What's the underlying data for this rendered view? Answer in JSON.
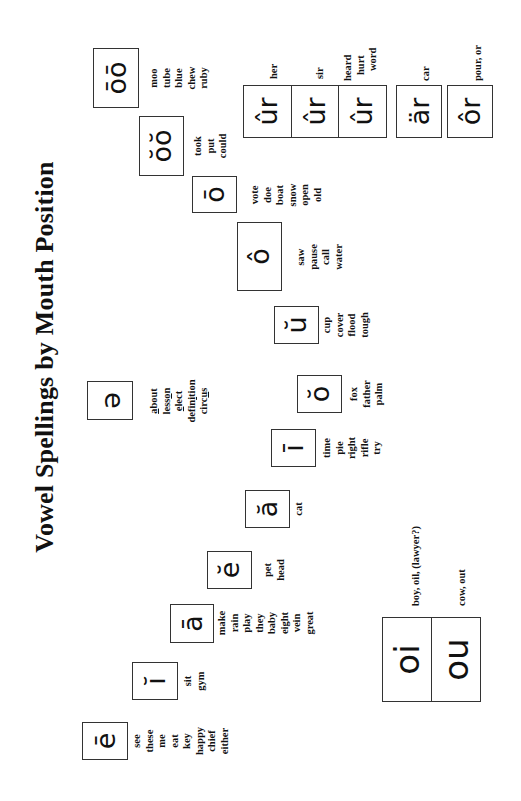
{
  "title": "Vowel Spellings by Mouth Position",
  "vowels": [
    {
      "symbol": "ē",
      "words": [
        "see",
        "these",
        "me",
        "eat",
        "key",
        "happy",
        "chief",
        "either"
      ]
    },
    {
      "symbol": "ĭ",
      "words": [
        "sit",
        "gym"
      ]
    },
    {
      "symbol": "ā",
      "words": [
        "make",
        "rain",
        "play",
        "they",
        "baby",
        "eight",
        "vein",
        "great"
      ]
    },
    {
      "symbol": "ĕ",
      "words": [
        "pet",
        "head"
      ]
    },
    {
      "symbol": "ă",
      "words": [
        "cat"
      ]
    },
    {
      "symbol": "ī",
      "words": [
        "time",
        "pie",
        "right",
        "rifle",
        "try"
      ]
    },
    {
      "symbol": "ŏ",
      "words": [
        "fox",
        "father",
        "palm"
      ]
    },
    {
      "symbol": "ŭ",
      "words": [
        "cup",
        "cover",
        "flood",
        "tough"
      ]
    },
    {
      "symbol": "ô",
      "words": [
        "saw",
        "pause",
        "call",
        "water"
      ]
    },
    {
      "symbol": "ō",
      "words": [
        "vote",
        "doe",
        "boat",
        "snow",
        "open",
        "old"
      ]
    },
    {
      "symbol": "ŏŏ",
      "words": [
        "took",
        "put",
        "could"
      ]
    },
    {
      "symbol": "ōō",
      "words": [
        "moo",
        "tube",
        "blue",
        "chew",
        "ruby"
      ]
    }
  ],
  "schwa": {
    "symbol": "ə",
    "words": [
      {
        "pre": "",
        "u": "a",
        "post": "bout"
      },
      {
        "pre": "less",
        "u": "o",
        "post": "n"
      },
      {
        "pre": "",
        "u": "e",
        "post": "lect"
      },
      {
        "pre": "defin",
        "u": "i",
        "post": "tion"
      },
      {
        "pre": "circ",
        "u": "u",
        "post": "s"
      }
    ]
  },
  "r_controlled": {
    "ur": [
      {
        "symbol": "ûr",
        "words": [
          "her"
        ]
      },
      {
        "symbol": "ûr",
        "words": [
          "sir"
        ]
      },
      {
        "symbol": "ûr",
        "words": [
          "heard",
          "hurt",
          "word"
        ]
      }
    ],
    "ar": {
      "symbol": "är",
      "words": [
        "car"
      ]
    },
    "or": {
      "symbol": "ôr",
      "words": [
        "pour, or"
      ]
    }
  },
  "diphthongs": [
    {
      "symbol": "oi",
      "label": "boy, oil, (lawyer?)"
    },
    {
      "symbol": "ou",
      "label": "cow, out"
    }
  ]
}
